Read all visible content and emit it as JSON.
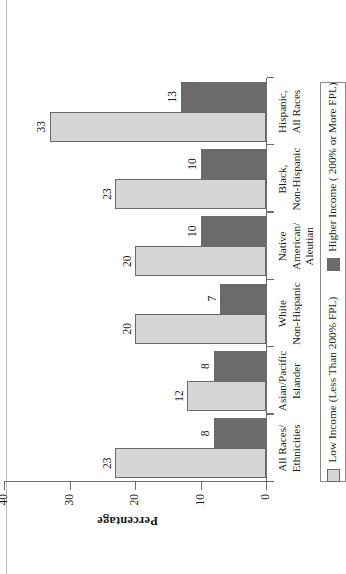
{
  "figure": {
    "orientation": "rotated-90-ccw",
    "page_edge": "vertical-rule"
  },
  "chart_data": {
    "type": "bar",
    "title": "",
    "xlabel": "",
    "ylabel": "Percentage",
    "ylim": [
      0,
      40
    ],
    "yticks": [
      "0",
      "10",
      "20",
      "30",
      "40"
    ],
    "grid": false,
    "legend_position": "bottom",
    "categories": [
      "All Races/\nEthnicities",
      "Asian/Pacific\nIslander",
      "White\nNon-Hispanic",
      "Native American/\nAleutian Eskimo",
      "Black,\nNon-Hispanic",
      "Hispanic,\nAll Races"
    ],
    "series": [
      {
        "name": "Low Income (Less Than 200% FPL)",
        "color": "#d6d6d6",
        "values": [
          23,
          12,
          20,
          20,
          23,
          33
        ]
      },
      {
        "name": "Higher Income ( 200% or More FPL)",
        "color": "#6b6b6b",
        "values": [
          8,
          8,
          7,
          10,
          10,
          13
        ]
      }
    ]
  },
  "axis": {
    "y_title": "Percentage",
    "ticks": [
      {
        "label": "0",
        "value": 0
      },
      {
        "label": "10",
        "value": 10
      },
      {
        "label": "20",
        "value": 20
      },
      {
        "label": "30",
        "value": 30
      },
      {
        "label": "40",
        "value": 40
      }
    ]
  },
  "categories": [
    {
      "line1": "All Races/",
      "line2": "Ethnicities"
    },
    {
      "line1": "Asian/Pacific",
      "line2": "Islander"
    },
    {
      "line1": "White",
      "line2": "Non-Hispanic"
    },
    {
      "line1": "Native American/",
      "line2": "Aleutian Eskimo"
    },
    {
      "line1": "Black,",
      "line2": "Non-Hispanic"
    },
    {
      "line1": "Hispanic,",
      "line2": "All Races"
    }
  ],
  "bars": [
    {
      "low": "23",
      "high": "8"
    },
    {
      "low": "12",
      "high": "8"
    },
    {
      "low": "20",
      "high": "7"
    },
    {
      "low": "20",
      "high": "10"
    },
    {
      "low": "23",
      "high": "10"
    },
    {
      "low": "33",
      "high": "13"
    }
  ],
  "legend": {
    "items": [
      {
        "label": "Low Income (Less Than 200% FPL)",
        "color": "#d6d6d6"
      },
      {
        "label": "Higher Income ( 200% or More FPL)",
        "color": "#6b6b6b"
      }
    ]
  },
  "colors": {
    "low_income": "#d6d6d6",
    "higher_income": "#6b6b6b",
    "axis": "#6e6e6e",
    "background": "#ffffff"
  }
}
